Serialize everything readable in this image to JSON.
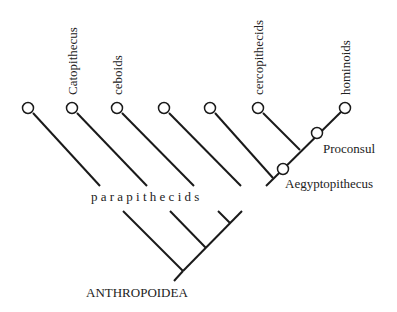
{
  "diagram": {
    "type": "cladogram",
    "root_label": "ANTHROPOIDEA",
    "group_label": "p a r a p i t h e c i d s",
    "tips": [
      {
        "label": "",
        "x": 28
      },
      {
        "label": "Catopithecus",
        "x": 72
      },
      {
        "label": "ceboids",
        "x": 117
      },
      {
        "label": "",
        "x": 164
      },
      {
        "label": "",
        "x": 210
      },
      {
        "label": "cercopithecids",
        "x": 258
      },
      {
        "label": "hominoids",
        "x": 345
      }
    ],
    "internal_nodes": [
      {
        "label": "Proconsul"
      },
      {
        "label": "Aegyptopithecus"
      }
    ],
    "colors": {
      "line": "#1a1a1a",
      "text": "#222222",
      "background": "#ffffff"
    }
  }
}
